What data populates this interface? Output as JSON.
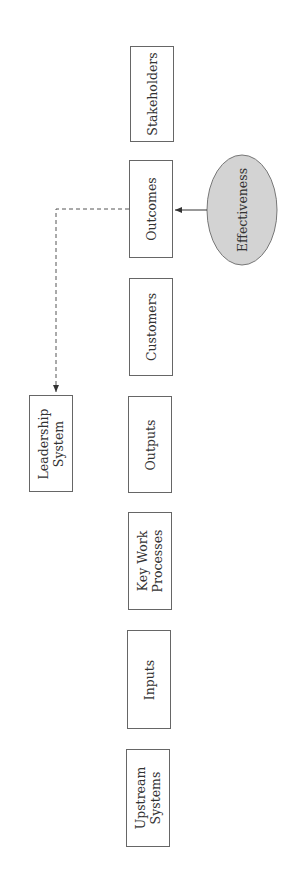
{
  "diagram": {
    "chain": [
      {
        "id": "stakeholders",
        "lines": [
          "Stakeholders"
        ]
      },
      {
        "id": "outcomes",
        "lines": [
          "Outcomes"
        ]
      },
      {
        "id": "customers",
        "lines": [
          "Customers"
        ]
      },
      {
        "id": "outputs",
        "lines": [
          "Outputs"
        ]
      },
      {
        "id": "key-work-processes",
        "lines": [
          "Key Work",
          "Processes"
        ]
      },
      {
        "id": "inputs",
        "lines": [
          "Inputs"
        ]
      },
      {
        "id": "upstream-systems",
        "lines": [
          "Upstream",
          "Systems"
        ]
      }
    ],
    "leadership": {
      "lines": [
        "Leadership",
        "System"
      ]
    },
    "effectiveness": {
      "label": "Effectiveness",
      "fill": "#d3d3d3"
    },
    "connectors": [
      {
        "from": "effectiveness",
        "to": "outcomes",
        "style": "solid",
        "arrow": true
      },
      {
        "from": "outcomes",
        "to": "leadership",
        "style": "dashed",
        "arrow": true
      }
    ],
    "colors": {
      "stroke": "#666666",
      "ellipse_fill": "#d3d3d3",
      "text": "#333333"
    }
  }
}
